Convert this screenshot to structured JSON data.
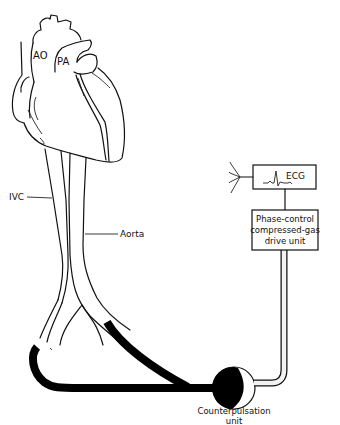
{
  "diagram": {
    "labels": {
      "ao": "AO",
      "pa": "PA",
      "ivc": "IVC",
      "aorta": "Aorta",
      "ecg": "ECG",
      "drive_unit_line1": "Phase-control",
      "drive_unit_line2": "compressed-gas",
      "drive_unit_line3": "drive unit",
      "counterpulsation_line1": "Counterpulsation",
      "counterpulsation_line2": "unit"
    },
    "colors": {
      "line": "#111111",
      "background": "#ffffff",
      "tube": "#000000",
      "gas_line": "#f2f2f2"
    }
  }
}
